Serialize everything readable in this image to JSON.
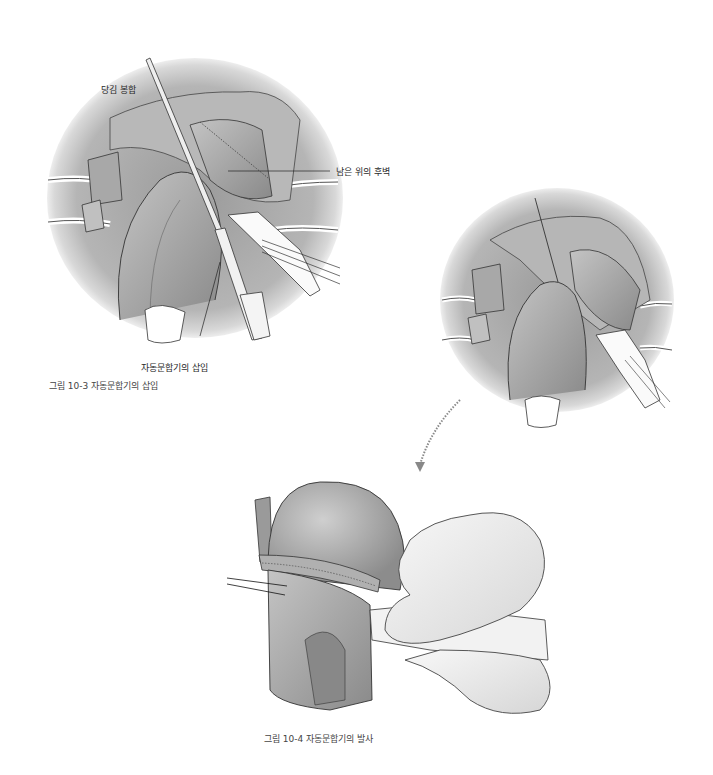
{
  "figure_10_3": {
    "caption": "그림 10-3  자동문합기의 삽입",
    "labels": {
      "traction_suture": "당김 봉합",
      "remnant_stomach_posterior_wall": "남은 위의 후벽",
      "stapler_insertion": "자동문합기의 삽입"
    }
  },
  "figure_10_4": {
    "caption": "그림 10-4  자동문합기의 발사"
  }
}
